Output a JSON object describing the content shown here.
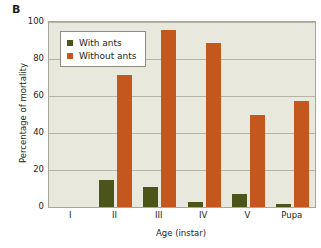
{
  "panel": {
    "label": "B"
  },
  "chart_data": {
    "type": "bar",
    "title": "",
    "xlabel": "Age (instar)",
    "ylabel": "Percentage of mortality",
    "categories": [
      "I",
      "II",
      "III",
      "IV",
      "V",
      "Pupa"
    ],
    "series": [
      {
        "name": "With ants",
        "color": "#4b5419",
        "values": [
          0,
          14.5,
          11,
          2.5,
          7,
          1.5
        ]
      },
      {
        "name": "Without ants",
        "color": "#c4571d",
        "values": [
          0,
          71.5,
          95.5,
          88.5,
          50,
          57.5
        ]
      }
    ],
    "ylim": [
      0,
      100
    ],
    "yticks": [
      0,
      20,
      40,
      60,
      80,
      100
    ],
    "grid": true,
    "legend_position": "top-left",
    "plot_background": "#e9e8dc"
  }
}
